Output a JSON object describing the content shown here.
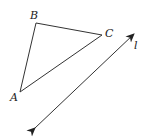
{
  "figure": {
    "type": "geometry",
    "width": 145,
    "height": 138,
    "stroke_color": "#333333"
  },
  "triangle": {
    "vertices": [
      {
        "name": "A",
        "x": 20,
        "y": 92,
        "label": "A",
        "label_x": 10,
        "label_y": 101
      },
      {
        "name": "B",
        "x": 36,
        "y": 23,
        "label": "B",
        "label_x": 30,
        "label_y": 19
      },
      {
        "name": "C",
        "x": 102,
        "y": 35,
        "label": "C",
        "label_x": 105,
        "label_y": 37
      }
    ]
  },
  "line": {
    "name": "l",
    "label": "l",
    "label_x": 134,
    "label_y": 49,
    "start": {
      "x": 35,
      "y": 128
    },
    "end": {
      "x": 134,
      "y": 34
    },
    "arrows": "both"
  }
}
